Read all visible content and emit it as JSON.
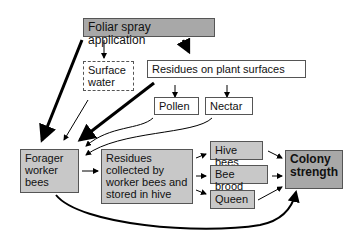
{
  "nodes": {
    "foliar": "Foliar spray application",
    "surface_water": "Surface water",
    "residues_plant": "Residues on plant surfaces",
    "pollen": "Pollen",
    "nectar": "Nectar",
    "forager": "Forager worker bees",
    "residues_hive": "Residues collected by worker bees and stored in hive",
    "hive_bees": "Hive bees",
    "bee_brood": "Bee brood",
    "queen": "Queen",
    "colony": "Colony strength"
  },
  "colors": {
    "box_grey": "#c8c8c8",
    "box_dark": "#a8a8a8",
    "line": "#000000"
  }
}
